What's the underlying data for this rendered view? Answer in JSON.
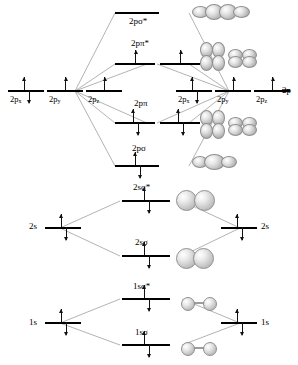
{
  "diagram": {
    "type": "mo-diagram"
  },
  "sections": {
    "p_block": {
      "left_atomic": [
        {
          "label": "2p",
          "sub": "x",
          "electrons": 2
        },
        {
          "label": "2p",
          "sub": "y",
          "electrons": 1
        },
        {
          "label": "2p",
          "sub": "z",
          "electrons": 1
        }
      ],
      "right_atomic": [
        {
          "label": "2p",
          "sub": "x",
          "electrons": 2
        },
        {
          "label": "2p",
          "sub": "y",
          "electrons": 1
        },
        {
          "label": "2p",
          "sub": "z",
          "electrons": 1
        }
      ],
      "right_group_label": "2p",
      "molecular": [
        {
          "label": "2p",
          "greek": "σ",
          "star": "*",
          "full": "2pσ*",
          "electrons": 0,
          "count": 1
        },
        {
          "label": "2p",
          "greek": "π",
          "star": "*",
          "full": "2pπ*",
          "electrons": 1,
          "count": 2
        },
        {
          "label": "2p",
          "greek": "π",
          "star": "",
          "full": "2pπ",
          "electrons": 2,
          "count": 2
        },
        {
          "label": "2p",
          "greek": "σ",
          "star": "",
          "full": "2pσ",
          "electrons": 2,
          "count": 1
        }
      ]
    },
    "s2_block": {
      "left_atomic": {
        "label": "2s",
        "electrons": 2
      },
      "right_atomic": {
        "label": "2s",
        "electrons": 2
      },
      "molecular": [
        {
          "full": "2sσ*",
          "electrons": 2
        },
        {
          "full": "2sσ",
          "electrons": 2
        }
      ]
    },
    "s1_block": {
      "left_atomic": {
        "label": "1s",
        "electrons": 2
      },
      "right_atomic": {
        "label": "1s",
        "electrons": 2
      },
      "molecular": [
        {
          "full": "1sσ*",
          "electrons": 2
        },
        {
          "full": "1sσ",
          "electrons": 2
        }
      ]
    }
  },
  "orbital_pictures": {
    "p_sigma_star": "four-lobe-horizontal",
    "p_pi_star_a": "four-lobe-vertical",
    "p_pi_star_b": "four-lobe-horizontal-pair",
    "p_pi_a": "four-lobe-vertical",
    "p_pi_b": "four-lobe-horizontal-pair",
    "p_sigma": "four-lobe-horizontal",
    "s2_sigma_star": "two-sphere",
    "s2_sigma": "two-sphere-fused",
    "s1_sigma_star": "two-small-sphere-bar",
    "s1_sigma": "two-small-sphere-bar"
  },
  "colors": {
    "line": "#000000",
    "connector": "#9a9a9a",
    "orbital_fill": "#c9c9c9",
    "background": "#ffffff"
  },
  "labels": {
    "p_sigma_star": "2pσ*",
    "p_pi_star": "2pπ*",
    "p_pi": "2pπ",
    "p_sigma": "2pσ",
    "s2_sigma_star": "2sσ*",
    "s2_sigma": "2sσ",
    "s1_sigma_star": "1sσ*",
    "s1_sigma": "1sσ",
    "two_p": "2p",
    "two_s": "2s",
    "one_s": "1s",
    "sub_x": "x",
    "sub_y": "y",
    "sub_z": "z"
  }
}
